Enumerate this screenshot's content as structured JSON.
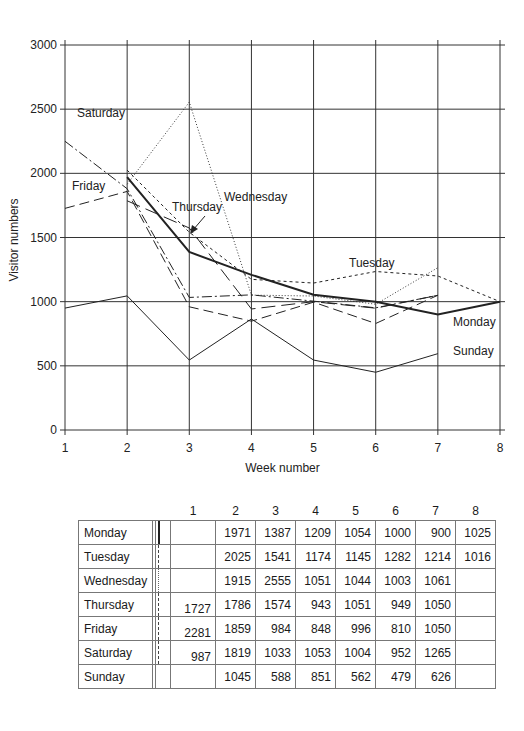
{
  "chart_data": {
    "type": "line",
    "title": "",
    "xlabel": "Week number",
    "ylabel": "Visitor numbers",
    "x": [
      1,
      2,
      3,
      4,
      5,
      6,
      7,
      8
    ],
    "xticks": [
      "1",
      "2",
      "3",
      "4",
      "5",
      "6",
      "7",
      "8"
    ],
    "yticks": [
      "0",
      "500",
      "1000",
      "1500",
      "2000",
      "2500",
      "3000"
    ],
    "ylim": [
      0,
      3000
    ],
    "xlim": [
      1,
      8
    ],
    "grid": true,
    "legend_position": "inline labels",
    "series": [
      {
        "name": "Monday",
        "values": [
          null,
          1971,
          1387,
          1209,
          1054,
          1000,
          900,
          1025
        ],
        "style": "solid-thick"
      },
      {
        "name": "Tuesday",
        "values": [
          null,
          2025,
          1541,
          1174,
          1145,
          1282,
          1214,
          1016
        ],
        "style": "dotted-short-dash"
      },
      {
        "name": "Wednesday",
        "values": [
          null,
          1915,
          2555,
          1051,
          1044,
          1003,
          1061,
          null
        ],
        "style": "dotted"
      },
      {
        "name": "Thursday",
        "values": [
          null,
          1786,
          1574,
          943,
          1051,
          949,
          1050,
          null
        ],
        "style": "long-dash-thin"
      },
      {
        "name": "Friday",
        "values": [
          1727,
          1859,
          984,
          848,
          996,
          810,
          1050,
          null
        ],
        "style": "dashed"
      },
      {
        "name": "Saturday",
        "values": [
          2281,
          1819,
          1033,
          1053,
          1004,
          952,
          1265,
          null
        ],
        "style": "dash-dot"
      },
      {
        "name": "Sunday",
        "values": [
          987,
          1045,
          588,
          851,
          562,
          479,
          626,
          null
        ],
        "style": "solid-thin"
      }
    ],
    "annotations": [
      "Saturday",
      "Friday",
      "Thursday",
      "Wednesday",
      "Tuesday",
      "Monday",
      "Sunday"
    ]
  },
  "table": {
    "headers": [
      "1",
      "2",
      "3",
      "4",
      "5",
      "6",
      "7",
      "8"
    ],
    "rows": [
      {
        "day": "Monday",
        "values": [
          "",
          "1971",
          "1387",
          "1209",
          "1054",
          "1000",
          "900",
          "1025"
        ]
      },
      {
        "day": "Tuesday",
        "values": [
          "",
          "2025",
          "1541",
          "1174",
          "1145",
          "1282",
          "1214",
          "1016"
        ]
      },
      {
        "day": "Wednesday",
        "values": [
          "",
          "1915",
          "2555",
          "1051",
          "1044",
          "1003",
          "1061",
          ""
        ]
      },
      {
        "day": "Thursday",
        "values": [
          "1727",
          "1786",
          "1574",
          "943",
          "1051",
          "949",
          "1050",
          ""
        ]
      },
      {
        "day": "Friday",
        "values": [
          "2281",
          "1859",
          "984",
          "848",
          "996",
          "810",
          "1050",
          ""
        ]
      },
      {
        "day": "Saturday",
        "values": [
          "987",
          "1819",
          "1033",
          "1053",
          "1004",
          "952",
          "1265",
          ""
        ]
      },
      {
        "day": "Sunday",
        "values": [
          "",
          "1045",
          "588",
          "851",
          "562",
          "479",
          "626",
          ""
        ]
      }
    ]
  }
}
